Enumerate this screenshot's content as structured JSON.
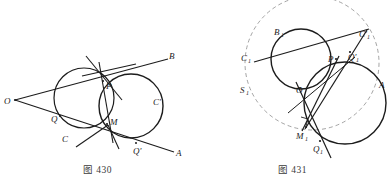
{
  "page": {
    "width": 390,
    "height": 189,
    "background": "#ffffff",
    "ink": "#1c1c1c",
    "dash_ink": "#8a8a8a"
  },
  "figures": [
    {
      "id": "figure-430",
      "caption": "图 430",
      "caption_number": "430",
      "description": "Two intersecting circles with external point O and two secant/tangent lines OB and OA",
      "circles": [
        {
          "name": "circle-C",
          "cx": 84,
          "cy": 98,
          "r": 30,
          "label": "C"
        },
        {
          "name": "circle-C-prime",
          "cx": 131,
          "cy": 106,
          "r": 32,
          "label": "C'"
        }
      ],
      "points": [
        {
          "name": "point-O",
          "label": "O",
          "x": 15,
          "y": 100,
          "lx": 6,
          "ly": 103
        },
        {
          "name": "point-B",
          "label": "B",
          "x": 165,
          "y": 60,
          "lx": 168,
          "ly": 58
        },
        {
          "name": "point-A",
          "label": "A",
          "x": 172,
          "y": 152,
          "lx": 175,
          "ly": 154
        },
        {
          "name": "point-P",
          "label": "P",
          "x": 103,
          "y": 81,
          "lx": 106,
          "ly": 88
        },
        {
          "name": "point-M",
          "label": "M",
          "x": 107,
          "y": 124,
          "lx": 110,
          "ly": 124
        },
        {
          "name": "point-Q",
          "label": "Q",
          "x": 60,
          "y": 116,
          "lx": 53,
          "ly": 121
        },
        {
          "name": "point-Q-prime",
          "label": "Q'",
          "x": 136,
          "y": 143,
          "lx": 135,
          "ly": 152
        },
        {
          "name": "label-C",
          "label": "C",
          "x": 72,
          "y": 133,
          "lx": 64,
          "ly": 140
        },
        {
          "name": "label-C-prime",
          "label": "C'",
          "x": 156,
          "y": 100,
          "lx": 155,
          "ly": 103
        }
      ],
      "lines": [
        {
          "name": "line-OB",
          "x1": 15,
          "y1": 100,
          "x2": 165,
          "y2": 60
        },
        {
          "name": "line-OA",
          "x1": 15,
          "y1": 100,
          "x2": 172,
          "y2": 152
        },
        {
          "name": "line-PM-chord",
          "x1": 100,
          "y1": 64,
          "x2": 112,
          "y2": 140
        },
        {
          "name": "line-through-P-steep",
          "x1": 88,
          "y1": 58,
          "x2": 120,
          "y2": 97
        },
        {
          "name": "line-through-P-shallow",
          "x1": 84,
          "y1": 75,
          "x2": 132,
          "y2": 66
        },
        {
          "name": "line-M-left-ray",
          "x1": 107,
          "y1": 124,
          "x2": 78,
          "y2": 146
        },
        {
          "name": "line-M-right-ray",
          "x1": 107,
          "y1": 124,
          "x2": 118,
          "y2": 148
        }
      ]
    },
    {
      "id": "figure-431",
      "caption": "图 431",
      "caption_number": "431",
      "description": "Two tangent circles with an auxiliary dashed circle, lines C1-C1' and S1, tangency chord through M1",
      "circles": [
        {
          "name": "circle-upper",
          "cx": 106,
          "cy": 59,
          "r": 30,
          "label": "B1"
        },
        {
          "name": "circle-lower-right",
          "cx": 150,
          "cy": 103,
          "r": 41,
          "label": "A"
        }
      ],
      "dashed_circle": {
        "name": "dashed-auxiliary-circle",
        "cx": 117,
        "cy": 63,
        "r": 67
      },
      "points": [
        {
          "name": "point-B1",
          "label": "B",
          "sub": "1",
          "x": 88,
          "y": 34,
          "lx": 81,
          "ly": 33
        },
        {
          "name": "point-C1",
          "label": "C",
          "sub": "1",
          "x": 58,
          "y": 60,
          "lx": 50,
          "ly": 59
        },
        {
          "name": "point-S1",
          "label": "S",
          "sub": "1",
          "x": 55,
          "y": 92,
          "lx": 48,
          "ly": 91
        },
        {
          "name": "point-C1-prime",
          "label": "C'",
          "sub": "1",
          "x": 168,
          "y": 36,
          "lx": 166,
          "ly": 35
        },
        {
          "name": "point-Q1-prime",
          "label": "Q'",
          "sub": "1",
          "x": 156,
          "y": 55,
          "lx": 155,
          "ly": 60
        },
        {
          "name": "point-P1",
          "label": "P",
          "sub": "",
          "x": 141,
          "y": 58,
          "lx": 135,
          "ly": 61
        },
        {
          "name": "point-O",
          "label": "O",
          "sub": "",
          "x": 106,
          "y": 89,
          "lx": 104,
          "ly": 92
        },
        {
          "name": "point-M1",
          "label": "M",
          "sub": "1",
          "x": 111,
          "y": 127,
          "lx": 104,
          "ly": 137
        },
        {
          "name": "point-Q1",
          "label": "Q",
          "sub": "1",
          "x": 124,
          "y": 141,
          "lx": 119,
          "ly": 150
        },
        {
          "name": "point-A",
          "label": "A",
          "sub": "",
          "x": 186,
          "y": 85,
          "lx": 185,
          "ly": 86
        }
      ],
      "lines": [
        {
          "name": "line-C1-to-Q1prime",
          "x1": 60,
          "y1": 62,
          "x2": 172,
          "y2": 31
        },
        {
          "name": "line-M1-to-C1prime",
          "x1": 111,
          "y1": 127,
          "x2": 170,
          "y2": 33
        },
        {
          "name": "line-O-to-Q1",
          "x1": 103,
          "y1": 86,
          "x2": 133,
          "y2": 155
        },
        {
          "name": "line-P-to-M1",
          "x1": 141,
          "y1": 58,
          "x2": 108,
          "y2": 130
        },
        {
          "name": "line-tangent-chord",
          "x1": 96,
          "y1": 109,
          "x2": 160,
          "y2": 60
        }
      ],
      "right_angle_marker": {
        "name": "right-angle-marker",
        "x": 109,
        "y": 118
      }
    }
  ]
}
